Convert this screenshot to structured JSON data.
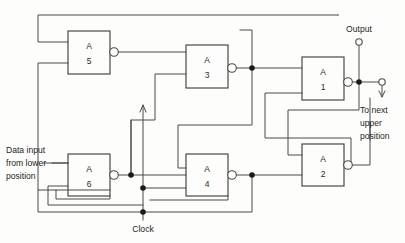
{
  "figure": {
    "colors": {
      "wire": "#4a4a4a",
      "junction": "#1a1a1a",
      "text": "#1f1f1f",
      "background": "#fdfdfb"
    }
  },
  "gates": [
    {
      "id": "a5",
      "letter": "A",
      "number": "5",
      "x": 68,
      "y": 31,
      "w": 42,
      "h": 43,
      "inverted": true
    },
    {
      "id": "a3",
      "letter": "A",
      "number": "3",
      "x": 186,
      "y": 45,
      "w": 42,
      "h": 43,
      "inverted": true
    },
    {
      "id": "a1",
      "letter": "A",
      "number": "1",
      "x": 302,
      "y": 57,
      "w": 42,
      "h": 43,
      "inverted": true
    },
    {
      "id": "a6",
      "letter": "A",
      "number": "6",
      "x": 68,
      "y": 154,
      "w": 42,
      "h": 42,
      "inverted": true
    },
    {
      "id": "a4",
      "letter": "A",
      "number": "4",
      "x": 186,
      "y": 154,
      "w": 42,
      "h": 42,
      "inverted": true
    },
    {
      "id": "a2",
      "letter": "A",
      "number": "2",
      "x": 302,
      "y": 144,
      "w": 42,
      "h": 42,
      "inverted": true
    }
  ],
  "labels": {
    "output": "Output",
    "to_next_line1": "To next",
    "to_next_line2": "upper",
    "to_next_line3": "position",
    "data_input_line1": "Data input",
    "data_input_line2": "from lower",
    "data_input_line3": "position",
    "clock": "Clock"
  },
  "terminals": [
    {
      "name": "output-terminal",
      "x": 359,
      "y": 42
    },
    {
      "name": "next-stage-terminal",
      "x": 382,
      "y": 82
    }
  ],
  "junctions": [
    {
      "name": "a3-output-junction",
      "x": 252,
      "y": 68
    },
    {
      "name": "a1-output-junction",
      "x": 359,
      "y": 82
    },
    {
      "name": "a6-output-junction",
      "x": 131,
      "y": 175
    },
    {
      "name": "clock-bus-junction",
      "x": 143,
      "y": 188
    },
    {
      "name": "a4-output-junction",
      "x": 252,
      "y": 175
    },
    {
      "name": "clock-top-junction",
      "x": 143,
      "y": 205
    }
  ]
}
